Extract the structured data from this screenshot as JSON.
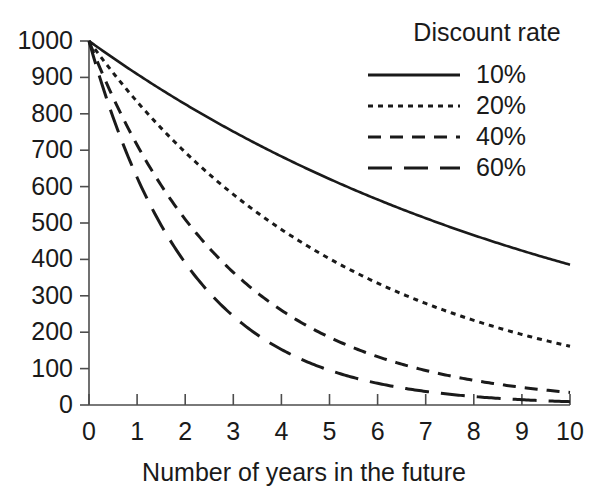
{
  "chart_data": {
    "type": "line",
    "title": "",
    "xlabel": "Number of years in the future",
    "ylabel": "",
    "xlim": [
      0,
      10
    ],
    "ylim": [
      0,
      1000
    ],
    "grid": false,
    "legend_position": "top-right",
    "legend_title": "Discount rate",
    "x": [
      0,
      1,
      2,
      3,
      4,
      5,
      6,
      7,
      8,
      9,
      10
    ],
    "xticks": [
      "0",
      "1",
      "2",
      "3",
      "4",
      "5",
      "6",
      "7",
      "8",
      "9",
      "10"
    ],
    "yticks": [
      "0",
      "100",
      "200",
      "300",
      "400",
      "500",
      "600",
      "700",
      "800",
      "900",
      "1000"
    ],
    "series": [
      {
        "name": "10%",
        "rate": 0.1,
        "style": "solid",
        "values": [
          1000,
          909,
          826,
          751,
          683,
          621,
          564,
          513,
          467,
          424,
          386
        ]
      },
      {
        "name": "20%",
        "rate": 0.2,
        "style": "dotted",
        "values": [
          1000,
          833,
          694,
          579,
          482,
          402,
          335,
          279,
          233,
          194,
          162
        ]
      },
      {
        "name": "40%",
        "rate": 0.4,
        "style": "dashed",
        "values": [
          1000,
          714,
          510,
          364,
          260,
          186,
          133,
          95,
          68,
          48,
          35
        ]
      },
      {
        "name": "60%",
        "rate": 0.6,
        "style": "long-dashed",
        "values": [
          1000,
          625,
          391,
          244,
          153,
          95,
          60,
          37,
          23,
          15,
          9
        ]
      }
    ]
  },
  "axis": {
    "x_title": "Number of years in the future"
  },
  "legend": {
    "title": "Discount rate",
    "entries": [
      {
        "label": "10%",
        "style": "solid"
      },
      {
        "label": "20%",
        "style": "dotted"
      },
      {
        "label": "40%",
        "style": "dashed"
      },
      {
        "label": "60%",
        "style": "long-dashed"
      }
    ]
  },
  "colors": {
    "line": "#1a1a1a",
    "axis": "#4d4d4d",
    "background": "#ffffff"
  }
}
